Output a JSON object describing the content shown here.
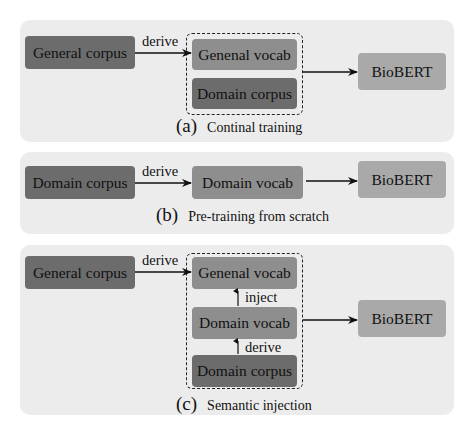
{
  "panels": {
    "a": {
      "tag": "(a)",
      "caption": "Continal training",
      "source": "General corpus",
      "edge_label": "derive",
      "group": [
        "Genenal vocab",
        "Domain corpus"
      ],
      "target": "BioBERT"
    },
    "b": {
      "tag": "(b)",
      "caption": "Pre-training from scratch",
      "source": "Domain corpus",
      "edge_label": "derive",
      "middle": "Domain vocab",
      "target": "BioBERT"
    },
    "c": {
      "tag": "(c)",
      "caption": "Semantic injection",
      "source": "General corpus",
      "edge_label": "derive",
      "group": [
        "Genenal vocab",
        "Domain vocab",
        "Domain corpus"
      ],
      "inner_labels": [
        "inject",
        "derive"
      ],
      "target": "BioBERT"
    }
  },
  "colors": {
    "panel_bg": "#ececec",
    "dark_box": "#6c6c6c",
    "mid_box": "#8e8e8e",
    "light_box": "#a9a9a9",
    "line": "#111111"
  }
}
